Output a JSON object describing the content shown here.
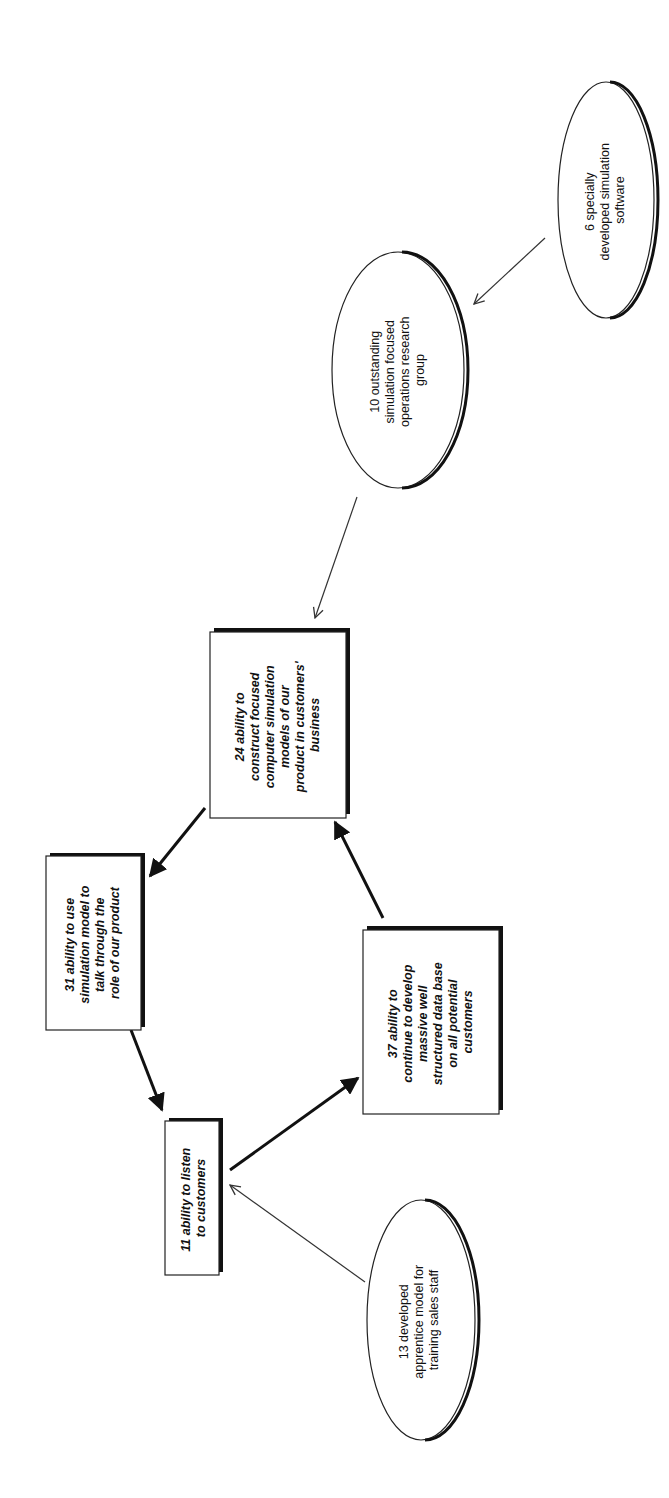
{
  "diagram": {
    "type": "cause-map",
    "orientation": "rotated-90-ccw",
    "nodes": [
      {
        "id": "6",
        "shape": "ellipse",
        "lines": [
          "6 specially",
          "developed simulation",
          "software"
        ]
      },
      {
        "id": "10",
        "shape": "ellipse",
        "lines": [
          "10 outstanding",
          "simulation focused",
          "operations research",
          "group"
        ]
      },
      {
        "id": "24",
        "shape": "box",
        "lines": [
          "24 ability to",
          "construct focused",
          "computer simulation",
          "models of our",
          "product in customers'",
          "business"
        ]
      },
      {
        "id": "31",
        "shape": "box",
        "lines": [
          "31 ability to use",
          "simulation model to",
          "talk through the",
          "role of our product"
        ]
      },
      {
        "id": "37",
        "shape": "box",
        "lines": [
          "37 ability to",
          "continue to develop",
          "massive well",
          "structured data base",
          "on all potential",
          "customers"
        ]
      },
      {
        "id": "11",
        "shape": "box",
        "lines": [
          "11 ability to listen",
          "to customers"
        ]
      },
      {
        "id": "13",
        "shape": "ellipse",
        "lines": [
          "13 developed",
          "apprentice model for",
          "training sales staff"
        ]
      }
    ],
    "edges": [
      {
        "from": "6",
        "to": "10",
        "style": "thin"
      },
      {
        "from": "10",
        "to": "24",
        "style": "thin"
      },
      {
        "from": "24",
        "to": "31",
        "style": "thick"
      },
      {
        "from": "31",
        "to": "11",
        "style": "thick"
      },
      {
        "from": "11",
        "to": "37",
        "style": "thick"
      },
      {
        "from": "37",
        "to": "24",
        "style": "thick"
      },
      {
        "from": "13",
        "to": "11",
        "style": "thin"
      }
    ]
  }
}
